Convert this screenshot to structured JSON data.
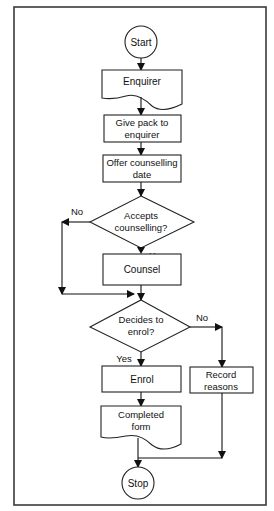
{
  "diagram": {
    "type": "flowchart",
    "nodes": {
      "start": {
        "shape": "terminator-circle",
        "label": "Start"
      },
      "enquirer": {
        "shape": "document",
        "label": "Enquirer"
      },
      "give_pack": {
        "shape": "process",
        "line1": "Give pack to",
        "line2": "enquirer"
      },
      "offer_date": {
        "shape": "process",
        "line1": "Offer counselling",
        "line2": "date"
      },
      "accepts": {
        "shape": "decision",
        "line1": "Accepts",
        "line2": "counselling?"
      },
      "counsel": {
        "shape": "process",
        "label": "Counsel"
      },
      "decides": {
        "shape": "decision",
        "line1": "Decides to",
        "line2": "enrol?"
      },
      "enrol": {
        "shape": "process",
        "label": "Enrol"
      },
      "record": {
        "shape": "process",
        "line1": "Record",
        "line2": "reasons"
      },
      "completed_form": {
        "shape": "document",
        "line1": "Completed",
        "line2": "form"
      },
      "stop": {
        "shape": "terminator-circle",
        "label": "Stop"
      }
    },
    "edge_labels": {
      "accepts_no": "No",
      "accepts_yes": "Yes",
      "decides_no": "No",
      "decides_yes": "Yes"
    },
    "edges": [
      {
        "from": "start",
        "to": "enquirer"
      },
      {
        "from": "enquirer",
        "to": "give_pack"
      },
      {
        "from": "give_pack",
        "to": "offer_date"
      },
      {
        "from": "offer_date",
        "to": "accepts"
      },
      {
        "from": "accepts",
        "to": "counsel",
        "label": "Yes"
      },
      {
        "from": "accepts",
        "to": "decides",
        "label": "No"
      },
      {
        "from": "counsel",
        "to": "decides"
      },
      {
        "from": "decides",
        "to": "enrol",
        "label": "Yes"
      },
      {
        "from": "decides",
        "to": "record",
        "label": "No"
      },
      {
        "from": "enrol",
        "to": "completed_form"
      },
      {
        "from": "completed_form",
        "to": "stop"
      },
      {
        "from": "record",
        "to": "stop"
      }
    ]
  }
}
